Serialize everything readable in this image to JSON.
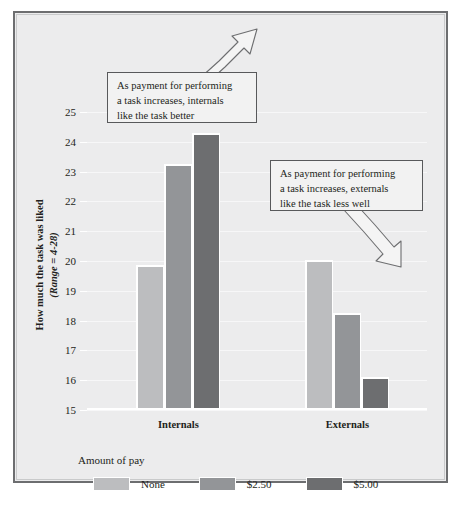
{
  "chart_data": {
    "type": "bar",
    "title": "",
    "xlabel": "",
    "ylabel": "How much the task was liked",
    "ylabel_sub": "(Range = 4-28)",
    "ylim": [
      15,
      25
    ],
    "yticks": [
      25,
      24,
      23,
      22,
      21,
      20,
      19,
      18,
      17,
      16,
      15
    ],
    "grid": true,
    "legend_position": "bottom-left",
    "legend_title": "Amount of pay",
    "categories": [
      "Internals",
      "Externals"
    ],
    "series": [
      {
        "name": "None",
        "color": "#bcbdbf",
        "values": [
          19.85,
          20.05
        ]
      },
      {
        "name": "$2.50",
        "color": "#939598",
        "values": [
          23.25,
          18.25
        ]
      },
      {
        "name": "$5.00",
        "color": "#6d6e70",
        "values": [
          24.3,
          16.1
        ]
      }
    ],
    "annotations": [
      {
        "id": "internals",
        "text": "As payment for performing a task increases, internals like the task better",
        "lines": [
          "As payment for performing",
          "a task increases, internals",
          "like the task better"
        ],
        "arrow_direction": "up-right"
      },
      {
        "id": "externals",
        "text": "As payment for performing a task increases, externals like the task less well",
        "lines": [
          "As payment for performing",
          "a task increases, externals",
          "like the task less well"
        ],
        "arrow_direction": "down-right"
      }
    ]
  },
  "figure": {
    "background": "#ececed",
    "border_color": "#6d6e70",
    "arrow_fill": "#f4f4f4",
    "arrow_stroke": "#6d6e70"
  }
}
